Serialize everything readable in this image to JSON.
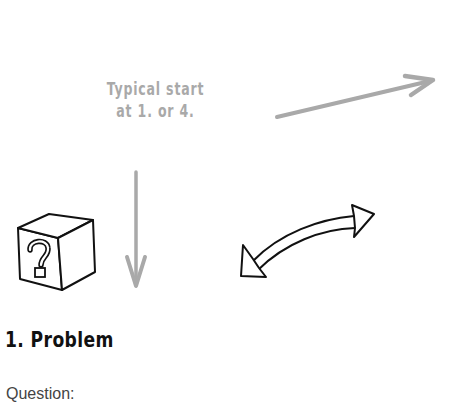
{
  "diagram": {
    "hint": {
      "lines": [
        "Typical start",
        "at 1. or 4."
      ],
      "color": "#a9a9a9"
    },
    "step": {
      "number": "1.",
      "title": "1. Problem",
      "icon": "question-box-icon"
    },
    "field_label": "Question:",
    "arrows": [
      {
        "name": "arrow-up-right",
        "color": "#a9a9a9"
      },
      {
        "name": "arrow-down",
        "color": "#a9a9a9"
      },
      {
        "name": "double-headed-curved-arrow",
        "color": "#000000"
      }
    ]
  }
}
